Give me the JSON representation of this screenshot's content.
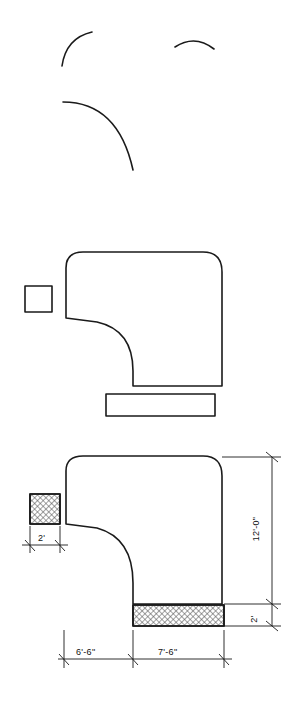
{
  "drawing": {
    "title": "",
    "stroke_color": "#1a1a1a",
    "hatch_color": "#555555",
    "background": "#ffffff",
    "line_weight_main": 1.6,
    "line_weight_dim": 0.9
  },
  "views": [
    {
      "name": "top-sketch-arcs",
      "description": "two freehand arc segments and a large quarter arc"
    },
    {
      "name": "middle-elevation",
      "description": "outline of duct elbow with small square at left and rectangle below"
    },
    {
      "name": "bottom-elevation-dimensioned",
      "description": "outline of duct elbow with hatched grille panels and dimensions"
    }
  ],
  "dimensions": [
    {
      "id": "height-12-0",
      "label": "12'-0\"",
      "orientation": "vertical"
    },
    {
      "id": "height-2-right",
      "label": "2'",
      "orientation": "vertical"
    },
    {
      "id": "width-2-left",
      "label": "2'",
      "orientation": "horizontal"
    },
    {
      "id": "width-6-6",
      "label": "6'-6\"",
      "orientation": "horizontal"
    },
    {
      "id": "width-7-6",
      "label": "7'-6\"",
      "orientation": "horizontal"
    }
  ]
}
